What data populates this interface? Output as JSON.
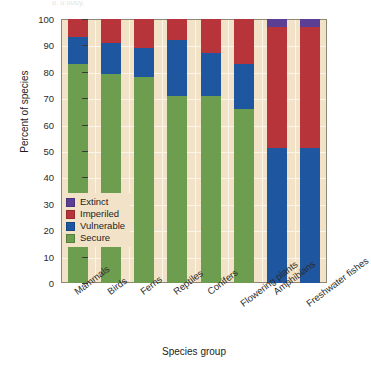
{
  "top_fragment": "u. u uuuy,",
  "axis": {
    "ylabel": "Percent of species",
    "xlabel": "Species group",
    "yticks": [
      "100",
      "90",
      "80",
      "70",
      "60",
      "50",
      "40",
      "30",
      "20",
      "10",
      "0"
    ]
  },
  "legend": {
    "items": [
      {
        "label": "Extinct",
        "color": "#5b3f94"
      },
      {
        "label": "Imperiled",
        "color": "#b8343b"
      },
      {
        "label": "Vulnerable",
        "color": "#1e56a0"
      },
      {
        "label": "Secure",
        "color": "#6d9d4e"
      }
    ]
  },
  "chart_data": {
    "type": "bar",
    "stacked": true,
    "title": "",
    "xlabel": "Species group",
    "ylabel": "Percent of species",
    "ylim": [
      0,
      100
    ],
    "ytick_step": 10,
    "grid": true,
    "legend_position": "inside-left",
    "categories": [
      "Mammals",
      "Birds",
      "Ferns",
      "Reptiles",
      "Conifers",
      "Flowering plants",
      "Amphibians",
      "Freshwater fishes"
    ],
    "series": [
      {
        "name": "Secure",
        "color": "#6d9d4e",
        "values": [
          83,
          79,
          78,
          71,
          71,
          66,
          0,
          0
        ]
      },
      {
        "name": "Vulnerable",
        "color": "#1e56a0",
        "values": [
          10,
          12,
          11,
          21,
          16,
          17,
          51,
          51
        ]
      },
      {
        "name": "Imperiled",
        "color": "#b8343b",
        "values": [
          7,
          9,
          11,
          8,
          13,
          17,
          46,
          46
        ]
      },
      {
        "name": "Extinct",
        "color": "#5b3f94",
        "values": [
          0,
          0,
          0,
          0,
          0,
          0,
          3,
          3
        ]
      }
    ],
    "panel_color": "#f2e3c8"
  }
}
